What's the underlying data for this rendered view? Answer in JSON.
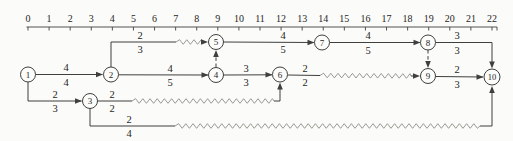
{
  "figure": {
    "kind": "time-scaled activity network (PERT/CPM with float shown as wavy lines)",
    "width": 513,
    "height": 141
  },
  "palette": {
    "background": "#fbfbf9",
    "line": "#3f3f3d",
    "wavy": "#8f8f88",
    "text": "#262624",
    "node_fill": "#fcfcfa"
  },
  "ruler": {
    "origin_x": 28,
    "step": 21.09,
    "labels_y": 21.5,
    "line_y": 27,
    "tick_len": 3.5,
    "line_x1": 26.5,
    "line_x2": 497,
    "labels": [
      "0",
      "1",
      "2",
      "3",
      "4",
      "5",
      "6",
      "7",
      "8",
      "9",
      "10",
      "11",
      "12",
      "13",
      "14",
      "15",
      "16",
      "17",
      "18",
      "19",
      "20",
      "21",
      "22"
    ]
  },
  "nodes": [
    {
      "id": "1",
      "x": 28,
      "y": 74.5,
      "r": 7.5
    },
    {
      "id": "2",
      "x": 111,
      "y": 74.5,
      "r": 7.5
    },
    {
      "id": "3",
      "x": 90,
      "y": 101,
      "r": 7.5
    },
    {
      "id": "4",
      "x": 216,
      "y": 75,
      "r": 7.5
    },
    {
      "id": "5",
      "x": 216,
      "y": 42,
      "r": 7.5
    },
    {
      "id": "6",
      "x": 280,
      "y": 74.5,
      "r": 7.5
    },
    {
      "id": "7",
      "x": 322,
      "y": 42.5,
      "r": 7.5
    },
    {
      "id": "8",
      "x": 428,
      "y": 42.5,
      "r": 7.5
    },
    {
      "id": "9",
      "x": 428,
      "y": 76,
      "r": 7.5
    },
    {
      "id": "10",
      "x": 492,
      "y": 77,
      "r": 8
    }
  ],
  "edges": [
    {
      "id": "1-2",
      "from": "1",
      "to": "2",
      "label": {
        "top": "4",
        "bottom": "4",
        "x": 66,
        "y": 74.5
      },
      "segments": [
        {
          "kind": "solid",
          "pts": [
            [
              35.5,
              74.5
            ],
            [
              102.5,
              74.5
            ]
          ]
        }
      ],
      "arrow": {
        "x": 103,
        "y": 74.5,
        "dir": "right"
      }
    },
    {
      "id": "1-3",
      "from": "1",
      "to": "3",
      "label": {
        "top": "2",
        "bottom": "3",
        "x": 55,
        "y": 101
      },
      "segments": [
        {
          "kind": "solid",
          "pts": [
            [
              28,
              82
            ],
            [
              28,
              101
            ],
            [
              81.5,
              101
            ]
          ]
        }
      ],
      "arrow": {
        "x": 82,
        "y": 101,
        "dir": "right"
      }
    },
    {
      "id": "2-5",
      "from": "2",
      "to": "5",
      "label": {
        "top": "2",
        "bottom": "3",
        "x": 140,
        "y": 42
      },
      "segments": [
        {
          "kind": "solid",
          "pts": [
            [
              111,
              67
            ],
            [
              111,
              42
            ],
            [
              176,
              42
            ]
          ]
        },
        {
          "kind": "zigzag",
          "pts": [
            [
              176,
              42
            ],
            [
              204,
              42
            ]
          ]
        }
      ],
      "arrow": {
        "x": 208,
        "y": 42,
        "dir": "right"
      }
    },
    {
      "id": "2-4",
      "from": "2",
      "to": "4",
      "label": {
        "top": "4",
        "bottom": "5",
        "x": 170,
        "y": 75
      },
      "segments": [
        {
          "kind": "solid",
          "pts": [
            [
              118.5,
              74.8
            ],
            [
              208,
              75
            ]
          ]
        }
      ],
      "arrow": {
        "x": 208.5,
        "y": 75,
        "dir": "right"
      }
    },
    {
      "id": "4-5-dummy",
      "from": "4",
      "to": "5",
      "label": null,
      "segments": [
        {
          "kind": "dashed",
          "pts": [
            [
              216,
              67
            ],
            [
              216,
              52.5
            ]
          ]
        }
      ],
      "arrow": {
        "x": 216,
        "y": 50,
        "dir": "up"
      }
    },
    {
      "id": "4-6",
      "from": "4",
      "to": "6",
      "label": {
        "top": "3",
        "bottom": "3",
        "x": 246,
        "y": 75
      },
      "segments": [
        {
          "kind": "solid",
          "pts": [
            [
              223.5,
              75
            ],
            [
              272,
              74.8
            ]
          ]
        }
      ],
      "arrow": {
        "x": 272.5,
        "y": 74.8,
        "dir": "right"
      }
    },
    {
      "id": "5-7",
      "from": "5",
      "to": "7",
      "label": {
        "top": "4",
        "bottom": "5",
        "x": 283,
        "y": 42
      },
      "segments": [
        {
          "kind": "solid",
          "pts": [
            [
              223.5,
              42
            ],
            [
              314,
              42.5
            ]
          ]
        }
      ],
      "arrow": {
        "x": 314.5,
        "y": 42.5,
        "dir": "right"
      }
    },
    {
      "id": "7-8",
      "from": "7",
      "to": "8",
      "label": {
        "top": "4",
        "bottom": "5",
        "x": 368,
        "y": 42.5
      },
      "segments": [
        {
          "kind": "solid",
          "pts": [
            [
              329.5,
              42.5
            ],
            [
              420,
              42.5
            ]
          ]
        }
      ],
      "arrow": {
        "x": 420.5,
        "y": 42.5,
        "dir": "right"
      }
    },
    {
      "id": "8-10",
      "from": "8",
      "to": "10",
      "label": {
        "top": "3",
        "bottom": "3",
        "x": 457,
        "y": 42.5
      },
      "segments": [
        {
          "kind": "solid",
          "pts": [
            [
              435.5,
              42.5
            ],
            [
              492,
              42.5
            ],
            [
              492,
              65.5
            ]
          ]
        }
      ],
      "arrow": {
        "x": 492,
        "y": 68.5,
        "dir": "down"
      }
    },
    {
      "id": "8-9-dummy",
      "from": "8",
      "to": "9",
      "label": null,
      "segments": [
        {
          "kind": "dashed",
          "pts": [
            [
              428,
              50
            ],
            [
              428,
              65.5
            ]
          ]
        }
      ],
      "arrow": {
        "x": 428,
        "y": 68,
        "dir": "down"
      }
    },
    {
      "id": "6-9",
      "from": "6",
      "to": "9",
      "label": {
        "top": "2",
        "bottom": "2",
        "x": 305,
        "y": 75
      },
      "segments": [
        {
          "kind": "solid",
          "pts": [
            [
              287.5,
              75
            ],
            [
              320,
              75.5
            ]
          ]
        },
        {
          "kind": "zigzag",
          "pts": [
            [
              320,
              75.5
            ],
            [
              411,
              76
            ]
          ]
        },
        {
          "kind": "solid",
          "pts": [
            [
              411,
              76
            ],
            [
              416.5,
              76
            ]
          ]
        }
      ],
      "arrow": {
        "x": 420,
        "y": 76,
        "dir": "right"
      }
    },
    {
      "id": "9-10",
      "from": "9",
      "to": "10",
      "label": {
        "top": "2",
        "bottom": "3",
        "x": 457,
        "y": 76.5
      },
      "segments": [
        {
          "kind": "solid",
          "pts": [
            [
              435.5,
              76.5
            ],
            [
              483,
              77
            ]
          ]
        }
      ],
      "arrow": {
        "x": 483.5,
        "y": 77,
        "dir": "right"
      }
    },
    {
      "id": "3-6",
      "from": "3",
      "to": "6",
      "label": {
        "top": "2",
        "bottom": "2",
        "x": 112,
        "y": 101
      },
      "segments": [
        {
          "kind": "solid",
          "pts": [
            [
              97.5,
              101
            ],
            [
              132,
              101
            ]
          ]
        },
        {
          "kind": "zigzag",
          "pts": [
            [
              132,
              101
            ],
            [
              274,
              101
            ]
          ]
        },
        {
          "kind": "solid",
          "pts": [
            [
              274,
              101
            ],
            [
              280,
              101
            ],
            [
              280,
              85
            ]
          ]
        }
      ],
      "arrow": {
        "x": 280,
        "y": 82.5,
        "dir": "up"
      }
    },
    {
      "id": "3-10",
      "from": "3",
      "to": "10",
      "label": {
        "top": "2",
        "bottom": "4",
        "x": 129,
        "y": 126
      },
      "segments": [
        {
          "kind": "solid",
          "pts": [
            [
              90,
              108.5
            ],
            [
              90,
              126
            ],
            [
              175,
              126
            ]
          ]
        },
        {
          "kind": "zigzag",
          "pts": [
            [
              175,
              126
            ],
            [
              480,
              126
            ]
          ]
        },
        {
          "kind": "solid",
          "pts": [
            [
              480,
              126
            ],
            [
              492,
              126
            ],
            [
              492,
              88.5
            ]
          ]
        }
      ],
      "arrow": {
        "x": 492,
        "y": 86,
        "dir": "up"
      }
    }
  ]
}
